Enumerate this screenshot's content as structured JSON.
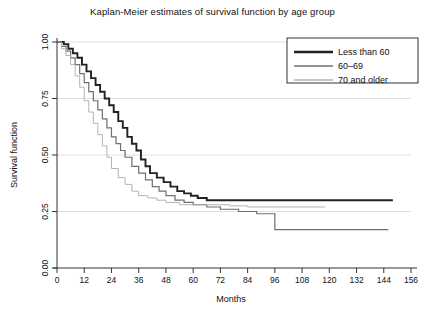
{
  "chart_data": {
    "type": "line",
    "title": "Kaplan-Meier estimates of survival function by age group",
    "xlabel": "Months",
    "ylabel": "Survival function",
    "xlim": [
      0,
      156
    ],
    "ylim": [
      0,
      1.0
    ],
    "xticks": [
      0,
      12,
      24,
      36,
      48,
      60,
      72,
      84,
      96,
      108,
      120,
      132,
      144,
      156
    ],
    "xtick_labels": [
      "0",
      "12",
      "24",
      "36",
      "48",
      "60",
      "72",
      "84",
      "96",
      "108",
      "120",
      "132",
      "144",
      "156"
    ],
    "yticks": [
      0.0,
      0.25,
      0.5,
      0.75,
      1.0
    ],
    "ytick_labels": [
      "0.00",
      "0.25",
      "0.50",
      "0.75",
      "1.00"
    ],
    "grid": "horizontal",
    "gridlines_at": [
      0.25,
      0.5,
      0.75,
      1.0
    ],
    "legend_position": "top-right",
    "step_type": "post",
    "series": [
      {
        "name": "Less than 60",
        "color": "#222222",
        "width": 1.9,
        "x": [
          0,
          3,
          5,
          7,
          9,
          11,
          13,
          15,
          17,
          19,
          21,
          23,
          25,
          27,
          29,
          31,
          33,
          35,
          37,
          39,
          41,
          44,
          47,
          50,
          53,
          56,
          59,
          62,
          66,
          148
        ],
        "y": [
          1.0,
          0.99,
          0.97,
          0.95,
          0.93,
          0.9,
          0.87,
          0.84,
          0.81,
          0.78,
          0.75,
          0.72,
          0.69,
          0.65,
          0.62,
          0.58,
          0.55,
          0.52,
          0.48,
          0.45,
          0.42,
          0.4,
          0.38,
          0.36,
          0.34,
          0.33,
          0.32,
          0.31,
          0.3,
          0.3
        ]
      },
      {
        "name": "60–69",
        "color": "#6f6f6f",
        "width": 1.2,
        "x": [
          0,
          2,
          4,
          6,
          8,
          10,
          12,
          14,
          16,
          18,
          20,
          22,
          24,
          26,
          28,
          30,
          33,
          36,
          39,
          42,
          45,
          48,
          52,
          56,
          60,
          66,
          72,
          80,
          88,
          96,
          146
        ],
        "y": [
          1.0,
          0.98,
          0.96,
          0.93,
          0.9,
          0.86,
          0.82,
          0.78,
          0.74,
          0.7,
          0.66,
          0.62,
          0.58,
          0.55,
          0.52,
          0.49,
          0.45,
          0.42,
          0.39,
          0.36,
          0.34,
          0.32,
          0.3,
          0.29,
          0.28,
          0.27,
          0.26,
          0.25,
          0.24,
          0.17,
          0.17
        ]
      },
      {
        "name": "70 and older",
        "color": "#b3b3b3",
        "width": 1.0,
        "x": [
          0,
          2,
          4,
          6,
          8,
          10,
          12,
          14,
          16,
          18,
          20,
          22,
          24,
          27,
          30,
          33,
          36,
          40,
          44,
          48,
          54,
          60,
          68,
          76,
          84,
          92,
          118
        ],
        "y": [
          1.0,
          0.97,
          0.94,
          0.9,
          0.85,
          0.8,
          0.74,
          0.69,
          0.64,
          0.59,
          0.54,
          0.49,
          0.44,
          0.4,
          0.37,
          0.34,
          0.32,
          0.31,
          0.3,
          0.29,
          0.28,
          0.28,
          0.28,
          0.275,
          0.27,
          0.27,
          0.27
        ]
      }
    ]
  },
  "legend": {
    "entries": [
      {
        "label": "Less than 60"
      },
      {
        "label": "60–69"
      },
      {
        "label": "70 and older"
      }
    ]
  }
}
